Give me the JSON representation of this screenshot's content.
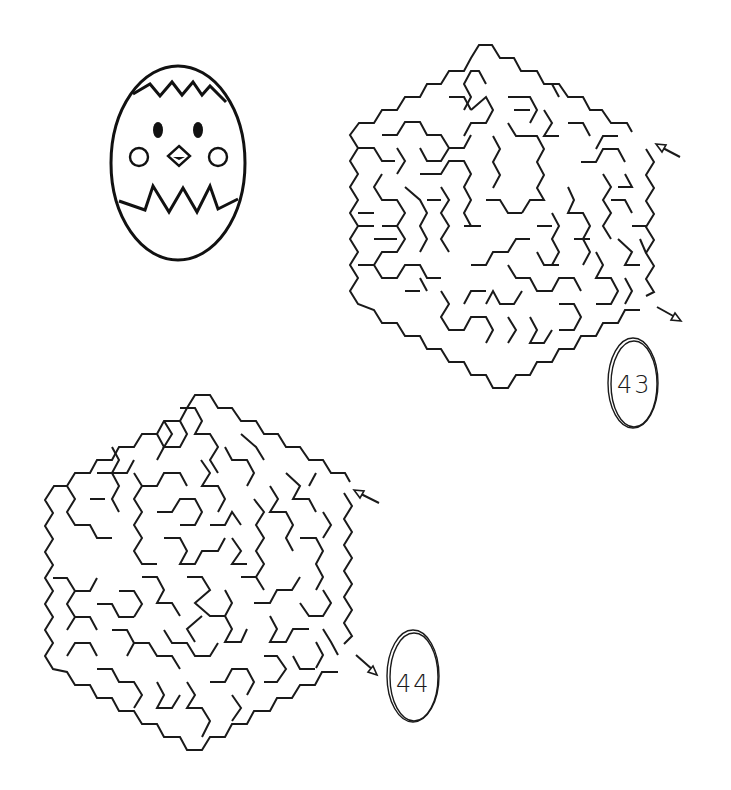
{
  "page": {
    "type": "maze worksheet",
    "background": "#ffffff",
    "ink_color": "#1a1a1a"
  },
  "decoration": {
    "name": "chick-in-egg",
    "description": "Cracked egg with chick face: two oval eyes, diamond beak, two round cheeks"
  },
  "mazes": [
    {
      "id": "maze-43",
      "number_label": "43",
      "shape": "hexagon",
      "start_arrow": "pointing-in (upper right)",
      "end_arrow": "pointing-out (lower right)"
    },
    {
      "id": "maze-44",
      "number_label": "44",
      "shape": "hexagon",
      "start_arrow": "pointing-in (upper right)",
      "end_arrow": "pointing-out (lower right)"
    }
  ]
}
